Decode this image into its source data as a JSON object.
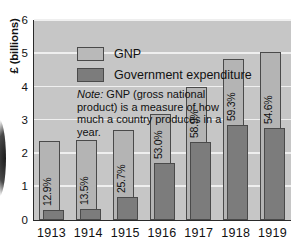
{
  "chart_data": {
    "type": "bar",
    "title": "",
    "xlabel": "",
    "ylabel": "£ (billions)",
    "ylim": [
      0,
      6
    ],
    "yticks": [
      "0",
      "1",
      "2",
      "3",
      "4",
      "5",
      "6"
    ],
    "grid": true,
    "legend_position": "top-left",
    "categories": [
      "1913",
      "1914",
      "1915",
      "1916",
      "1917",
      "1918",
      "1919"
    ],
    "series": [
      {
        "name": "GNP",
        "color": "#b4b4b4",
        "values": [
          2.38,
          2.4,
          2.72,
          3.2,
          4.0,
          4.83,
          5.05
        ]
      },
      {
        "name": "Government expenditure",
        "color": "#7c7c7c",
        "values": [
          0.31,
          0.33,
          0.7,
          1.7,
          2.36,
          2.87,
          2.76
        ]
      }
    ],
    "annotations": [
      "12.9%",
      "13.5%",
      "25.7%",
      "53.0%",
      "58.9%",
      "59.3%",
      "54.6%"
    ],
    "note": "Note: GNP (gross national product) is a measure of how much a country produces in a year.",
    "note_prefix": "Note:",
    "note_body": " GNP (gross national product) is a measure of how much a country produces in a year."
  },
  "legend": {
    "items": [
      {
        "label": "GNP"
      },
      {
        "label": "Government expenditure"
      }
    ]
  },
  "axes": {
    "y_title": "£ (billions)",
    "y_ticks": [
      "6",
      "5",
      "4",
      "3",
      "2",
      "1",
      "0"
    ],
    "x_ticks": [
      "1913",
      "1914",
      "1915",
      "1916",
      "1917",
      "1918",
      "1919"
    ]
  },
  "colors": {
    "gnp": "#b4b4b4",
    "gov": "#7c7c7c",
    "plot_background": "#c6c6c6",
    "gridline": "#efefef",
    "axis": "#2a2a2a",
    "text": "#111111"
  }
}
